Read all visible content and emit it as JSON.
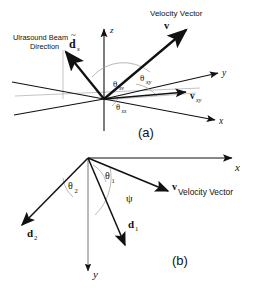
{
  "figure": {
    "type": "vector-geometry-diagram",
    "background_color": "#ffffff",
    "line_color": "#111111",
    "arc_color": "#9a9a9a",
    "axis_thin_color": "#777777"
  },
  "panel_a": {
    "caption": "(a)",
    "beam_label_line1": "Ulrasound Beam",
    "beam_label_line2": "Direction",
    "beam_symbol": "d",
    "beam_symbol_subscript": "s",
    "beam_symbol_accent": "~",
    "velocity_label": "Velocity Vector",
    "velocity_symbol": "v",
    "projection_symbol": "v",
    "projection_subscript": "xy",
    "axes": [
      {
        "name": "z-axis",
        "label": "z"
      },
      {
        "name": "y-axis",
        "label": "y"
      },
      {
        "name": "x-axis",
        "label": "x"
      }
    ],
    "angles": [
      {
        "name": "angle-sv",
        "symbol": "θ",
        "subscript": "sv"
      },
      {
        "name": "angle-xy",
        "symbol": "θ",
        "subscript": "xy"
      },
      {
        "name": "angle-xx",
        "symbol": "θ",
        "subscript": "xx"
      }
    ]
  },
  "panel_b": {
    "caption": "(b)",
    "velocity_label": "Velocity Vector",
    "velocity_symbol": "v",
    "beam1_symbol": "d",
    "beam1_subscript": "1",
    "beam2_symbol": "d",
    "beam2_subscript": "2",
    "axes": [
      {
        "name": "x-axis",
        "label": "x"
      },
      {
        "name": "y-axis",
        "label": "y"
      }
    ],
    "angles": [
      {
        "name": "angle-theta2",
        "symbol": "θ",
        "subscript": "2"
      },
      {
        "name": "angle-theta1",
        "symbol": "θ",
        "subscript": "1"
      },
      {
        "name": "angle-psi",
        "symbol": "ψ",
        "subscript": ""
      }
    ]
  }
}
